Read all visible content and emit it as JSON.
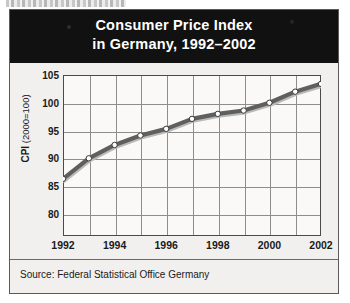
{
  "figure": {
    "title_line1": "Consumer Price Index",
    "title_line2": "in Germany, 1992–2002",
    "source": "Source: Federal Statistical Office Germany",
    "colors": {
      "title_band": "#111111",
      "title_text": "#ffffff",
      "line": "#5f5f5f",
      "marker_fill": "#ffffff",
      "marker_edge": "#3a3a3a",
      "grid": "#8d8d8d",
      "frame": "#4a4a4a",
      "plot_background": "#faf9f7",
      "figure_background": "#f1f0ee"
    },
    "yaxis_title_prefix": "CPI",
    "yaxis_title_suffix": " (2000=100)"
  },
  "chart_data": {
    "type": "line",
    "title": "Consumer Price Index in Germany, 1992–2002",
    "xlabel": "",
    "ylabel": "CPI (2000=100)",
    "x": [
      1992,
      1993,
      1994,
      1995,
      1996,
      1997,
      1998,
      1999,
      2000,
      2001,
      2002
    ],
    "values": [
      86.3,
      90.0,
      92.4,
      94.1,
      95.3,
      97.1,
      98.0,
      98.6,
      100.0,
      102.0,
      103.4
    ],
    "series": [
      {
        "name": "CPI (2000=100)",
        "values": [
          86.3,
          90.0,
          92.4,
          94.1,
          95.3,
          97.1,
          98.0,
          98.6,
          100.0,
          102.0,
          103.4
        ]
      }
    ],
    "xlim": [
      1992,
      2002
    ],
    "ylim": [
      76.0,
      105.0
    ],
    "yticks": [
      80,
      85,
      90,
      95,
      100,
      105
    ],
    "ytick_labels": [
      "80",
      "85",
      "90",
      "95",
      "100",
      "105"
    ],
    "xticks": [
      1992,
      1994,
      1996,
      1998,
      2000,
      2002
    ],
    "xtick_labels": [
      "1992",
      "1994",
      "1996",
      "1998",
      "2000",
      "2002"
    ],
    "grid": true,
    "legend": "none",
    "markers": "circle",
    "annotations": [
      "Source: Federal Statistical Office Germany"
    ]
  }
}
